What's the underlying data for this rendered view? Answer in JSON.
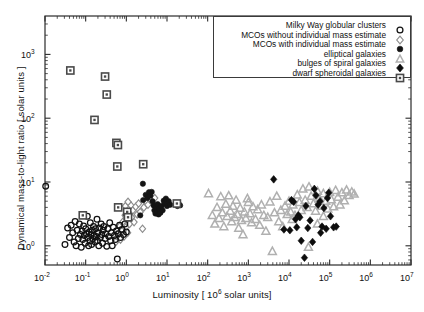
{
  "chart_data": {
    "type": "scatter",
    "title": "",
    "xlabel": "Luminosity   [ 10^6 solar units]",
    "xlabel_pre": "Luminosity   [ 10",
    "xlabel_sup": "6",
    "xlabel_post": " solar units]",
    "ylabel": "Dynamical mass-to-light ratio  [ solar units ]",
    "xscale": "log",
    "yscale": "log",
    "xlim": [
      0.01,
      10000000
    ],
    "ylim": [
      0.5,
      4000
    ],
    "xticks": [
      "10^-2",
      "10^-1",
      "10^0",
      "10^1",
      "10^2",
      "10^3",
      "10^4",
      "10^5",
      "10^6",
      "10^7"
    ],
    "xtick_exponents": [
      "-2",
      "-1",
      "0",
      "1",
      "2",
      "3",
      "4",
      "5",
      "6",
      "7"
    ],
    "ytick_exponents": [
      "0",
      "1",
      "2",
      "3"
    ],
    "yticks": [
      "10^0",
      "10^1",
      "10^2",
      "10^3"
    ],
    "grid": false,
    "legend_position": "top-right",
    "series": [
      {
        "name": "Milky Way globular clusters",
        "marker": "open-circle",
        "color": "#111111",
        "points": [
          [
            0.0104,
            8.6
          ],
          [
            0.031,
            1.05
          ],
          [
            0.036,
            1.9
          ],
          [
            0.04,
            1.35
          ],
          [
            0.044,
            2.1
          ],
          [
            0.048,
            1.6
          ],
          [
            0.052,
            1.15
          ],
          [
            0.055,
            2.4
          ],
          [
            0.058,
            1.0
          ],
          [
            0.062,
            1.75
          ],
          [
            0.066,
            1.3
          ],
          [
            0.07,
            2.2
          ],
          [
            0.074,
            1.5
          ],
          [
            0.078,
            0.95
          ],
          [
            0.082,
            1.7
          ],
          [
            0.085,
            1.25
          ],
          [
            0.089,
            2.05
          ],
          [
            0.093,
            1.45
          ],
          [
            0.097,
            1.1
          ],
          [
            0.1,
            1.85
          ],
          [
            0.105,
            1.55
          ],
          [
            0.11,
            2.9
          ],
          [
            0.112,
            1.35
          ],
          [
            0.118,
            1.0
          ],
          [
            0.122,
            1.65
          ],
          [
            0.127,
            1.2
          ],
          [
            0.13,
            2.3
          ],
          [
            0.136,
            1.5
          ],
          [
            0.14,
            1.05
          ],
          [
            0.145,
            1.75
          ],
          [
            0.15,
            1.3
          ],
          [
            0.156,
            2.0
          ],
          [
            0.162,
            1.45
          ],
          [
            0.17,
            1.15
          ],
          [
            0.175,
            1.85
          ],
          [
            0.18,
            1.4
          ],
          [
            0.19,
            2.6
          ],
          [
            0.195,
            1.2
          ],
          [
            0.2,
            1.6
          ],
          [
            0.21,
            1.0
          ],
          [
            0.22,
            1.9
          ],
          [
            0.23,
            1.35
          ],
          [
            0.24,
            2.2
          ],
          [
            0.25,
            1.5
          ],
          [
            0.26,
            1.1
          ],
          [
            0.27,
            1.75
          ],
          [
            0.28,
            2.0
          ],
          [
            0.3,
            1.3
          ],
          [
            0.31,
            1.55
          ],
          [
            0.33,
            0.98
          ],
          [
            0.35,
            1.85
          ],
          [
            0.37,
            1.4
          ],
          [
            0.39,
            2.3
          ],
          [
            0.41,
            1.2
          ],
          [
            0.43,
            1.6
          ],
          [
            0.45,
            1.0
          ],
          [
            0.48,
            1.95
          ],
          [
            0.51,
            1.45
          ],
          [
            0.54,
            1.25
          ],
          [
            0.57,
            1.7
          ],
          [
            0.6,
            0.62
          ],
          [
            0.63,
            1.55
          ],
          [
            0.68,
            2.1
          ],
          [
            0.72,
            1.35
          ],
          [
            0.78,
            1.8
          ],
          [
            0.85,
            1.5
          ],
          [
            0.92,
            2.2
          ],
          [
            1.0,
            1.65
          ]
        ]
      },
      {
        "name": "MCOs without individual mass estimate",
        "marker": "open-diamond",
        "color": "#8c8c8c",
        "points": [
          [
            0.55,
            1.15
          ],
          [
            0.62,
            1.5
          ],
          [
            0.68,
            2.0
          ],
          [
            0.72,
            1.25
          ],
          [
            0.78,
            1.7
          ],
          [
            0.83,
            2.4
          ],
          [
            0.88,
            1.4
          ],
          [
            0.93,
            3.0
          ],
          [
            0.97,
            1.95
          ],
          [
            1.02,
            2.6
          ],
          [
            1.08,
            1.6
          ],
          [
            1.15,
            3.4
          ],
          [
            1.2,
            2.2
          ],
          [
            1.3,
            4.3
          ],
          [
            1.35,
            2.8
          ],
          [
            1.45,
            3.6
          ],
          [
            1.55,
            2.35
          ],
          [
            1.7,
            4.1
          ],
          [
            1.85,
            3.1
          ],
          [
            2.0,
            4.6
          ],
          [
            2.2,
            3.4
          ],
          [
            2.5,
            1.85
          ],
          [
            2.7,
            4.0
          ],
          [
            3.0,
            5.0
          ],
          [
            3.4,
            4.4
          ],
          [
            3.9,
            5.3
          ],
          [
            4.4,
            4.8
          ],
          [
            5.0,
            5.6
          ],
          [
            0.95,
            4.2
          ],
          [
            1.1,
            4.9
          ]
        ]
      },
      {
        "name": "MCOs with individual mass estimate",
        "marker": "filled-circle",
        "color": "#141414",
        "points": [
          [
            2.55,
            9.4
          ],
          [
            2.2,
            3.0
          ],
          [
            2.6,
            5.2
          ],
          [
            3.0,
            6.3
          ],
          [
            3.3,
            5.6
          ],
          [
            3.6,
            6.9
          ],
          [
            3.9,
            6.1
          ],
          [
            4.2,
            7.0
          ],
          [
            4.4,
            5.0
          ],
          [
            4.7,
            4.3
          ],
          [
            4.9,
            3.6
          ],
          [
            5.2,
            3.2
          ],
          [
            5.4,
            4.0
          ],
          [
            5.6,
            3.4
          ],
          [
            5.9,
            4.5
          ],
          [
            6.2,
            3.1
          ],
          [
            6.5,
            3.8
          ],
          [
            6.9,
            3.3
          ],
          [
            7.3,
            4.2
          ],
          [
            7.8,
            3.6
          ],
          [
            8.3,
            5.1
          ],
          [
            8.8,
            4.6
          ],
          [
            9.4,
            5.5
          ],
          [
            10.0,
            4.2
          ],
          [
            11.0,
            5.0
          ],
          [
            12.0,
            4.4
          ],
          [
            16.5,
            4.6
          ],
          [
            18.0,
            4.2
          ],
          [
            19.5,
            4.5
          ],
          [
            21.0,
            4.3
          ]
        ]
      },
      {
        "name": "elliptical galaxies",
        "marker": "open-triangle",
        "color": "#b0b0b0",
        "points": [
          [
            105,
            6.6
          ],
          [
            130,
            3.0
          ],
          [
            150,
            2.2
          ],
          [
            170,
            4.0
          ],
          [
            190,
            2.7
          ],
          [
            210,
            5.9
          ],
          [
            230,
            3.3
          ],
          [
            250,
            2.0
          ],
          [
            280,
            4.5
          ],
          [
            300,
            2.9
          ],
          [
            330,
            6.1
          ],
          [
            360,
            3.5
          ],
          [
            390,
            2.4
          ],
          [
            420,
            4.2
          ],
          [
            460,
            2.8
          ],
          [
            500,
            5.2
          ],
          [
            540,
            3.1
          ],
          [
            580,
            1.9
          ],
          [
            630,
            3.9
          ],
          [
            680,
            2.5
          ],
          [
            740,
            1.5
          ],
          [
            800,
            3.4
          ],
          [
            870,
            2.7
          ],
          [
            950,
            5.5
          ],
          [
            1000,
            4.8
          ],
          [
            1100,
            3.2
          ],
          [
            1200,
            2.3
          ],
          [
            1300,
            4.1
          ],
          [
            1500,
            2.6
          ],
          [
            1700,
            3.7
          ],
          [
            1900,
            2.1
          ],
          [
            2100,
            4.4
          ],
          [
            2400,
            3.0
          ],
          [
            2700,
            1.7
          ],
          [
            3000,
            2.8
          ],
          [
            3400,
            4.9
          ],
          [
            3900,
            0.82
          ],
          [
            4400,
            3.3
          ],
          [
            5000,
            6.0
          ],
          [
            5600,
            2.4
          ],
          [
            6300,
            3.6
          ],
          [
            7000,
            2.0
          ],
          [
            8000,
            4.2
          ],
          [
            9000,
            3.1
          ],
          [
            10000,
            5.0
          ],
          [
            11000,
            3.4
          ],
          [
            12500,
            4.4
          ],
          [
            14000,
            3.0
          ],
          [
            16000,
            6.3
          ],
          [
            18000,
            4.8
          ],
          [
            20000,
            3.6
          ],
          [
            22000,
            7.8
          ],
          [
            25000,
            5.2
          ],
          [
            28000,
            4.0
          ],
          [
            31000,
            8.4
          ],
          [
            35000,
            6.0
          ],
          [
            40000,
            4.6
          ],
          [
            45000,
            3.5
          ],
          [
            50000,
            7.2
          ],
          [
            56000,
            5.5
          ],
          [
            63000,
            4.2
          ],
          [
            70000,
            6.6
          ],
          [
            80000,
            5.0
          ],
          [
            90000,
            3.8
          ],
          [
            100000,
            6.9
          ],
          [
            110000,
            5.3
          ],
          [
            125000,
            4.1
          ],
          [
            140000,
            7.4
          ],
          [
            160000,
            5.8
          ],
          [
            180000,
            4.4
          ],
          [
            200000,
            6.8
          ],
          [
            230000,
            5.1
          ],
          [
            260000,
            7.5
          ],
          [
            300000,
            6.2
          ],
          [
            350000,
            7.0
          ],
          [
            400000,
            6.5
          ],
          [
            12000,
            2.6
          ],
          [
            30000,
            0.95
          ],
          [
            50000,
            2.2
          ],
          [
            70000,
            2.9
          ]
        ]
      },
      {
        "name": "bulges of spiral galaxies",
        "marker": "filled-diamond",
        "color": "#0d0d0d",
        "points": [
          [
            4200,
            11.0
          ],
          [
            7500,
            1.8
          ],
          [
            10500,
            1.75
          ],
          [
            11500,
            5.2
          ],
          [
            13000,
            4.9
          ],
          [
            14500,
            2.6
          ],
          [
            15500,
            1.95
          ],
          [
            17000,
            3.0
          ],
          [
            18500,
            2.8
          ],
          [
            20000,
            1.2
          ],
          [
            24000,
            0.65
          ],
          [
            26000,
            4.2
          ],
          [
            29000,
            1.9
          ],
          [
            33000,
            2.5
          ],
          [
            38000,
            1.15
          ],
          [
            42000,
            7.8
          ],
          [
            46000,
            6.2
          ],
          [
            52000,
            4.4
          ],
          [
            58000,
            5.0
          ],
          [
            65000,
            2.0
          ],
          [
            72000,
            3.9
          ],
          [
            82000,
            1.85
          ],
          [
            95000,
            6.8
          ],
          [
            105000,
            2.9
          ],
          [
            125000,
            1.95
          ],
          [
            145000,
            2.0
          ],
          [
            60000,
            1.6
          ],
          [
            88000,
            5.6
          ]
        ]
      },
      {
        "name": "dwarf spheroidal galaxies",
        "marker": "square-dot",
        "color": "#4a4a4a",
        "points": [
          [
            0.042,
            560
          ],
          [
            0.085,
            3.0
          ],
          [
            0.165,
            94
          ],
          [
            0.3,
            450
          ],
          [
            0.33,
            235
          ],
          [
            0.57,
            41
          ],
          [
            0.62,
            38
          ],
          [
            0.6,
            17.5
          ],
          [
            0.63,
            4.0
          ],
          [
            1.05,
            3.4
          ],
          [
            1.1,
            2.8
          ],
          [
            2.6,
            19.0
          ],
          [
            17.5,
            4.6
          ]
        ]
      }
    ]
  },
  "axes": {
    "x_tick_labels": [
      "-2",
      "-1",
      "0",
      "1",
      "2",
      "3",
      "4",
      "5",
      "6",
      "7"
    ],
    "y_tick_labels": [
      "0",
      "1",
      "2",
      "3"
    ],
    "base": "10"
  },
  "legend": {
    "items": [
      {
        "label": "Milky Way globular clusters",
        "marker": "open-circle"
      },
      {
        "label": "MCOs without individual mass estimate",
        "marker": "open-diamond"
      },
      {
        "label": "MCOs with individual mass estimate",
        "marker": "filled-circle"
      },
      {
        "label": "elliptical galaxies",
        "marker": "open-triangle"
      },
      {
        "label": "bulges of spiral galaxies",
        "marker": "filled-diamond"
      },
      {
        "label": "dwarf spheroidal galaxies",
        "marker": "square-dot"
      }
    ]
  },
  "labels": {
    "ylabel": "Dynamical mass-to-light ratio  [ solar units ]",
    "xlabel_pre": "Luminosity   [ 10",
    "xlabel_sup": "6",
    "xlabel_post": " solar units]"
  },
  "colors": {
    "axis": "#2b2b2b",
    "globular": "#111111",
    "mco_open": "#8c8c8c",
    "mco_filled": "#141414",
    "elliptical": "#b0b0b0",
    "bulge": "#0d0d0d",
    "dwarf": "#4a4a4a",
    "background": "#ffffff"
  }
}
